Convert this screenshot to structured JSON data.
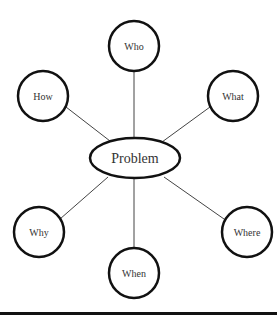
{
  "diagram": {
    "type": "mind-map",
    "center": {
      "label": "Problem",
      "cx": 135,
      "cy": 158,
      "rx": 45,
      "ry": 20
    },
    "nodes": [
      {
        "id": "who",
        "label": "Who",
        "cx": 134,
        "cy": 46,
        "r": 25
      },
      {
        "id": "how",
        "label": "How",
        "cx": 43,
        "cy": 96,
        "r": 25
      },
      {
        "id": "what",
        "label": "What",
        "cx": 233,
        "cy": 96,
        "r": 25
      },
      {
        "id": "why",
        "label": "Why",
        "cx": 39,
        "cy": 232,
        "r": 25
      },
      {
        "id": "where",
        "label": "Where",
        "cx": 247,
        "cy": 232,
        "r": 25
      },
      {
        "id": "when",
        "label": "When",
        "cx": 134,
        "cy": 273,
        "r": 25
      }
    ],
    "colors": {
      "stroke": "#111111",
      "line": "#444444",
      "text": "#333333",
      "background": "#ffffff"
    }
  }
}
